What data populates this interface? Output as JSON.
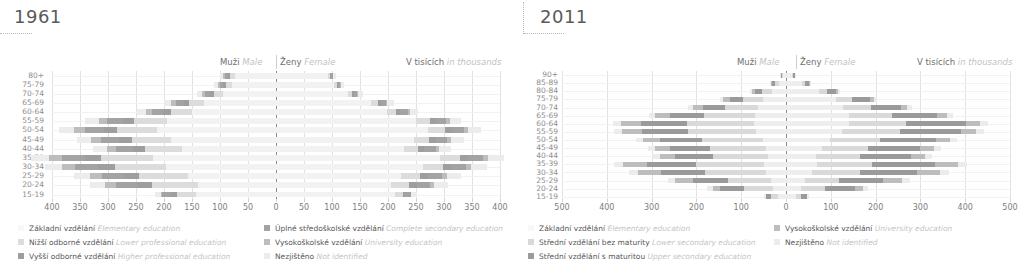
{
  "colors": {
    "elementary": "#f2f2f2",
    "lower_secondary": "#d8d8d8",
    "upper_secondary": "#9a9a9a",
    "university": "#bdbdbd",
    "not_identified": "#ececec",
    "lower_professional": "#dcdcdc",
    "higher_professional": "#9e9e9e",
    "complete_secondary": "#a3a3a3",
    "axis": "#8a8a8a",
    "grid": "#e2e2e2",
    "text_cz": "#6e6e6e",
    "text_en": "#c2c2c2"
  },
  "panels": [
    {
      "title": "1961",
      "header": {
        "male_cz": "Muži",
        "male_en": "Male",
        "female_cz": "Ženy",
        "female_en": "Female",
        "units_cz": "V tisících",
        "units_en": "in thousands"
      },
      "chart_data": {
        "type": "bar",
        "title": "1961",
        "xlabel": "V tisících / in thousands",
        "ylabel": "",
        "xlim": [
          -400,
          400
        ],
        "xticks": [
          400,
          350,
          300,
          250,
          200,
          150,
          100,
          50,
          0,
          50,
          100,
          150,
          200,
          250,
          300,
          350,
          400
        ],
        "grid": true,
        "legend_position": "bottom",
        "categories": [
          "80+",
          "75-79",
          "70-74",
          "65-69",
          "60-64",
          "55-59",
          "50-54",
          "45-49",
          "40-44",
          "35-39",
          "30-34",
          "25-29",
          "20-24",
          "15-19"
        ],
        "series": [
          {
            "name": "Základní vzdělání",
            "name_en": "Elementary education",
            "color": "#f2f2f2",
            "male": [
              73,
              78,
              95,
              128,
              150,
              195,
              212,
              188,
              168,
              220,
              196,
              158,
              140,
              143
            ],
            "female": [
              92,
              104,
              128,
              170,
              198,
              250,
              272,
              246,
              228,
              292,
              262,
              224,
              206,
              212
            ]
          },
          {
            "name": "Nižší odborné vzdělání",
            "name_en": "Lower professional education",
            "color": "#dcdcdc",
            "male": [
              9,
              11,
              16,
              27,
              38,
              58,
              72,
              70,
              66,
              92,
              92,
              86,
              82,
              34
            ],
            "female": [
              4,
              5,
              8,
              12,
              17,
              25,
              30,
              28,
              26,
              36,
              36,
              34,
              32,
              14
            ]
          },
          {
            "name": "Vyšší odborné vzdělání",
            "name_en": "Higher professional education",
            "color": "#9e9e9e",
            "male": [
              4,
              5,
              7,
              10,
              14,
              20,
              24,
              23,
              22,
              30,
              30,
              28,
              27,
              11
            ],
            "female": [
              2,
              2,
              3,
              5,
              7,
              10,
              12,
              11,
              11,
              15,
              15,
              14,
              13,
              5
            ]
          },
          {
            "name": "Úplné středoškolské vzdělání",
            "name_en": "Complete secondary education",
            "color": "#a3a3a3",
            "male": [
              5,
              6,
              9,
              14,
              19,
              28,
              33,
              31,
              29,
              41,
              41,
              38,
              36,
              15
            ],
            "female": [
              3,
              4,
              6,
              9,
              13,
              19,
              22,
              21,
              20,
              27,
              27,
              25,
              24,
              10
            ]
          },
          {
            "name": "Vysokoškolské vzdělání",
            "name_en": "University education",
            "color": "#bdbdbd",
            "male": [
              3,
              3,
              5,
              8,
              11,
              16,
              19,
              18,
              17,
              23,
              23,
              22,
              20,
              2
            ],
            "female": [
              1,
              1,
              2,
              3,
              4,
              6,
              7,
              7,
              6,
              9,
              9,
              8,
              8,
              1
            ]
          },
          {
            "name": "Nezjištěno",
            "name_en": "Not identified",
            "color": "#ececec",
            "male": [
              6,
              7,
              9,
              13,
              17,
              24,
              27,
              25,
              24,
              32,
              31,
              28,
              27,
              12
            ],
            "female": [
              5,
              6,
              8,
              11,
              15,
              21,
              24,
              22,
              21,
              28,
              27,
              25,
              24,
              10
            ]
          }
        ]
      },
      "legend": [
        {
          "label_cz": "Základní vzdělání",
          "label_en": "Elementary education",
          "color": "#f7f7f7",
          "col": 0
        },
        {
          "label_cz": "Nižší odborné vzdělání",
          "label_en": "Lower professional education",
          "color": "#dcdcdc",
          "col": 0
        },
        {
          "label_cz": "Vyšší odborné vzdělání",
          "label_en": "Higher professional education",
          "color": "#9e9e9e",
          "col": 0
        },
        {
          "label_cz": "Úplné středoškolské vzdělání",
          "label_en": "Complete secondary education",
          "color": "#a3a3a3",
          "col": 1
        },
        {
          "label_cz": "Vysokoškolské vzdělání",
          "label_en": "University education",
          "color": "#bdbdbd",
          "col": 1
        },
        {
          "label_cz": "Nezjištěno",
          "label_en": "Not identified",
          "color": "#ececec",
          "col": 1
        }
      ]
    },
    {
      "title": "2011",
      "header": {
        "male_cz": "Muži",
        "male_en": "Male",
        "female_cz": "Ženy",
        "female_en": "Female",
        "units_cz": "V tisících",
        "units_en": "in thousands"
      },
      "chart_data": {
        "type": "bar",
        "title": "2011",
        "xlabel": "V tisících / in thousands",
        "ylabel": "",
        "xlim": [
          -500,
          500
        ],
        "xticks": [
          500,
          400,
          300,
          200,
          100,
          0,
          100,
          200,
          300,
          400,
          500
        ],
        "grid": true,
        "legend_position": "bottom",
        "categories": [
          "90+",
          "85-89",
          "80-84",
          "75-79",
          "70-74",
          "65-69",
          "60-64",
          "55-59",
          "50-54",
          "45-49",
          "40-44",
          "35-39",
          "30-34",
          "25-29",
          "20-24",
          "15-19"
        ],
        "series": [
          {
            "name": "Základní vzdělání",
            "name_en": "Elementary education",
            "color": "#eeeeee",
            "male": [
              6,
              16,
              32,
              52,
              62,
              70,
              72,
              66,
              52,
              44,
              40,
              50,
              44,
              34,
              28,
              18
            ],
            "female": [
              14,
              36,
              74,
              112,
              128,
              140,
              140,
              126,
              98,
              80,
              66,
              70,
              58,
              42,
              34,
              22
            ]
          },
          {
            "name": "Střední vzdělání bez maturity",
            "name_en": "Lower secondary education",
            "color": "#d9d9d9",
            "male": [
              3,
              9,
              22,
              44,
              74,
              112,
              150,
              152,
              136,
              126,
              122,
              152,
              136,
              96,
              66,
              16
            ],
            "female": [
              2,
              7,
              18,
              36,
              62,
              96,
              128,
              128,
              112,
              104,
              100,
              122,
              108,
              76,
              52,
              12
            ]
          },
          {
            "name": "Střední vzdělání s maturitou",
            "name_en": "Upper secondary education",
            "color": "#9a9a9a",
            "male": [
              2,
              6,
              15,
              30,
              50,
              76,
              102,
              104,
              94,
              88,
              86,
              108,
              98,
              78,
              54,
              10
            ],
            "female": [
              3,
              8,
              20,
              40,
              66,
              100,
              134,
              136,
              124,
              116,
              112,
              140,
              126,
              98,
              68,
              12
            ]
          },
          {
            "name": "Vysokoškolské vzdělání",
            "name_en": "University education",
            "color": "#bdbdbd",
            "male": [
              1,
              3,
              7,
              14,
              22,
              34,
              44,
              44,
              38,
              34,
              34,
              54,
              52,
              40,
              16,
              1
            ],
            "female": [
              1,
              2,
              5,
              9,
              15,
              23,
              32,
              34,
              32,
              30,
              32,
              52,
              52,
              44,
              18,
              1
            ]
          },
          {
            "name": "Nezjištěno",
            "name_en": "Not identified",
            "color": "#ececec",
            "male": [
              1,
              2,
              4,
              7,
              10,
              14,
              18,
              18,
              16,
              15,
              15,
              20,
              20,
              16,
              12,
              4
            ],
            "female": [
              1,
              2,
              4,
              7,
              10,
              14,
              18,
              18,
              16,
              15,
              15,
              20,
              20,
              16,
              12,
              4
            ]
          }
        ]
      },
      "legend": [
        {
          "label_cz": "Základní vzdělání",
          "label_en": "Elementary education",
          "color": "#f7f7f7",
          "col": 0
        },
        {
          "label_cz": "Střední vzdělání bez maturity",
          "label_en": "Lower secondary education",
          "color": "#d9d9d9",
          "col": 0
        },
        {
          "label_cz": "Střední vzdělání s maturitou",
          "label_en": "Upper secondary education",
          "color": "#9a9a9a",
          "col": 0
        },
        {
          "label_cz": "Vysokoškolské vzdělání",
          "label_en": "University education",
          "color": "#bdbdbd",
          "col": 1
        },
        {
          "label_cz": "Nezjištěno",
          "label_en": "Not identified",
          "color": "#ececec",
          "col": 1
        }
      ]
    }
  ]
}
